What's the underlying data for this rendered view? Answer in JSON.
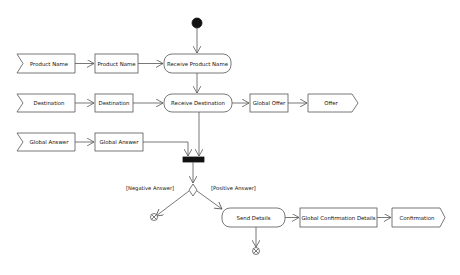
{
  "diagram": {
    "type": "uml-activity",
    "colors": {
      "stroke": "#555555",
      "fill": "#ffffff",
      "node": "#111111",
      "text": "#111111"
    },
    "accept_events": [
      {
        "id": "ae-product-name",
        "label": "Product Name"
      },
      {
        "id": "ae-destination",
        "label": "Destination"
      },
      {
        "id": "ae-global-answer",
        "label": "Global Answer"
      }
    ],
    "object_nodes": [
      {
        "id": "obj-product-name",
        "label": "Product Name"
      },
      {
        "id": "obj-destination",
        "label": "Destination"
      },
      {
        "id": "obj-global-answer",
        "label": "Global Answer"
      },
      {
        "id": "obj-global-offer",
        "label": "Global Offer"
      },
      {
        "id": "obj-global-confirmation",
        "label": "Global Confirmation Details"
      }
    ],
    "actions": [
      {
        "id": "act-receive-product-name",
        "label": "Receive Product Name"
      },
      {
        "id": "act-receive-destination",
        "label": "Receive Destination"
      },
      {
        "id": "act-send-details",
        "label": "Send Details"
      }
    ],
    "send_signals": [
      {
        "id": "sig-offer",
        "label": "Offer"
      },
      {
        "id": "sig-confirmation",
        "label": "Confirmation"
      }
    ],
    "guards": {
      "negative": "[Negative Answer]",
      "positive": "[Positive Answer]"
    }
  }
}
